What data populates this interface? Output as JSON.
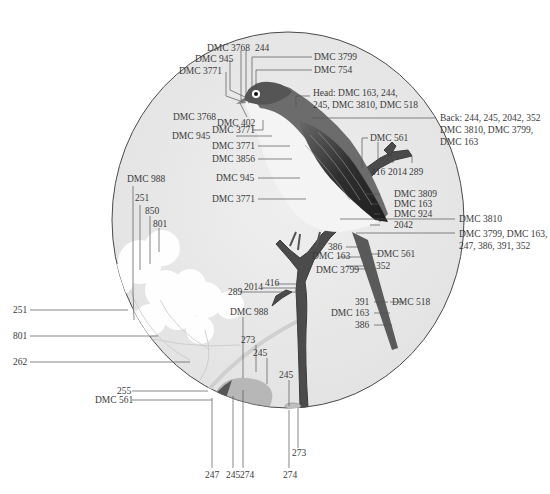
{
  "diagram": {
    "colors": {
      "circle_fill": "#e9e9e9",
      "circle_stroke": "#4a4a4a",
      "leader_line": "#555555",
      "bird_back": "#3f3f3f",
      "bird_belly": "#f4f4f4",
      "branch": "#4b4b4b"
    }
  },
  "labels": {
    "top": {
      "dmc3768_top": "DMC 3768",
      "n244_top": "244",
      "dmc945_top": "DMC 945",
      "dmc3771_top": "DMC 3771",
      "dmc3799_top": "DMC 3799",
      "dmc754": "DMC 754",
      "head_line1": "Head: DMC 163, 244,",
      "head_line2": "245, DMC 3810, DMC 518",
      "back_line1": "Back: 244, 245, 2042, 352",
      "back_line2": "DMC 3810, DMC 3799,",
      "back_line3": "DMC 163"
    },
    "left_body": {
      "dmc3768": "DMC 3768",
      "dmc402": "DMC 402",
      "dmc3771_a": "DMC 3771",
      "dmc945_a": "DMC 945",
      "dmc3771_b": "DMC 3771",
      "dmc3856": "DMC 3856",
      "dmc945_b": "DMC 945",
      "dmc3771_c": "DMC 3771"
    },
    "branch_right": {
      "dmc561_top": "DMC 561",
      "n416": "416",
      "n2014": "2014",
      "n289": "289",
      "dmc3809": "DMC 3809",
      "dmc163": "DMC 163",
      "dmc924": "DMC 924",
      "dmc3810": "DMC 3810",
      "n2042": "2042",
      "tail_line1": "DMC 3799, DMC 163,",
      "tail_line2": "247, 386, 391, 352"
    },
    "tail": {
      "n386_a": "386",
      "dmc163_a": "DMC 163",
      "dmc561": "DMC 561",
      "dmc3799": "DMC 3799",
      "n352": "352",
      "n391": "391",
      "dmc518": "DMC 518",
      "dmc163_b": "DMC 163",
      "n386_b": "386"
    },
    "lower_branch": {
      "n416": "416",
      "n2014": "2014",
      "n289": "289"
    },
    "flowers": {
      "dmc988": "DMC 988",
      "n251": "251",
      "n850": "850",
      "n801": "801",
      "left251": "251",
      "left801": "801",
      "left262": "262"
    },
    "leaf": {
      "dmc988": "DMC 988",
      "n273": "273",
      "n245": "245",
      "n255": "255",
      "dmc561": "DMC 561",
      "bottom247": "247",
      "bottom245": "245",
      "bottom274a": "274",
      "twig245": "245",
      "twig273": "273",
      "bottom274b": "274"
    }
  }
}
